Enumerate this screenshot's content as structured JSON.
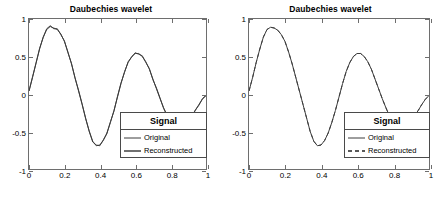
{
  "figure": {
    "background": "#ffffff",
    "axis_color": "#6e6e6e",
    "line_color": "#3c3c3c"
  },
  "panels": [
    {
      "id": "left",
      "title": "Daubechies wavelet",
      "legend": {
        "title": "Signal",
        "entries": [
          {
            "label": "Original",
            "style": "solid"
          },
          {
            "label": "Reconstructed",
            "style": "solid"
          }
        ]
      }
    },
    {
      "id": "right",
      "title": "Daubechies wavelet",
      "legend": {
        "title": "Signal",
        "entries": [
          {
            "label": "Original",
            "style": "solid"
          },
          {
            "label": "Reconstructed",
            "style": "dashed"
          }
        ]
      }
    }
  ],
  "axes": {
    "xticks": [
      "0",
      "0.2",
      "0.4",
      "0.6",
      "0.8",
      "1"
    ],
    "xtick_values": [
      0,
      0.2,
      0.4,
      0.6,
      0.8,
      1
    ],
    "yticks": [
      "1",
      "0.5",
      "0",
      "-0.5",
      "-1"
    ],
    "ytick_values": [
      1,
      0.5,
      0,
      -0.5,
      -1
    ],
    "xlim": [
      0,
      1
    ],
    "ylim": [
      -1,
      1
    ]
  },
  "chart_data": {
    "type": "line",
    "title": "Daubechies wavelet",
    "xlabel": "",
    "ylabel": "",
    "xlim": [
      0,
      1
    ],
    "ylim": [
      -1,
      1
    ],
    "grid": false,
    "legend_position": "lower right",
    "legend_title": "Signal",
    "charts": [
      {
        "panel": "left",
        "title": "Daubechies wavelet",
        "note": "Reconstructed signal overlays original; trace shows slight quantization ripple",
        "x": [
          0.0,
          0.02,
          0.04,
          0.06,
          0.08,
          0.1,
          0.12,
          0.14,
          0.16,
          0.18,
          0.2,
          0.22,
          0.24,
          0.26,
          0.28,
          0.3,
          0.32,
          0.34,
          0.36,
          0.38,
          0.4,
          0.42,
          0.44,
          0.46,
          0.48,
          0.5,
          0.52,
          0.54,
          0.56,
          0.58,
          0.6,
          0.62,
          0.64,
          0.66,
          0.68,
          0.7,
          0.72,
          0.74,
          0.76,
          0.78,
          0.8,
          0.82,
          0.84,
          0.86,
          0.88,
          0.9,
          0.92,
          0.94,
          0.96,
          0.98,
          1.0
        ],
        "series": [
          {
            "name": "Original",
            "style": "solid",
            "values": [
              0.04,
              0.22,
              0.42,
              0.6,
              0.76,
              0.86,
              0.9,
              0.88,
              0.86,
              0.8,
              0.7,
              0.56,
              0.4,
              0.22,
              0.04,
              -0.14,
              -0.32,
              -0.5,
              -0.63,
              -0.69,
              -0.68,
              -0.62,
              -0.52,
              -0.38,
              -0.22,
              -0.04,
              0.14,
              0.3,
              0.42,
              0.5,
              0.54,
              0.54,
              0.5,
              0.43,
              0.33,
              0.2,
              0.07,
              -0.06,
              -0.18,
              -0.29,
              -0.37,
              -0.41,
              -0.43,
              -0.43,
              -0.41,
              -0.36,
              -0.29,
              -0.22,
              -0.14,
              -0.07,
              -0.02
            ]
          },
          {
            "name": "Reconstructed",
            "style": "solid",
            "values": [
              0.04,
              0.23,
              0.41,
              0.61,
              0.75,
              0.87,
              0.91,
              0.87,
              0.87,
              0.79,
              0.71,
              0.55,
              0.41,
              0.21,
              0.05,
              -0.13,
              -0.33,
              -0.49,
              -0.64,
              -0.68,
              -0.69,
              -0.61,
              -0.53,
              -0.37,
              -0.23,
              -0.03,
              0.15,
              0.29,
              0.43,
              0.49,
              0.55,
              0.53,
              0.51,
              0.42,
              0.34,
              0.19,
              0.08,
              -0.05,
              -0.19,
              -0.28,
              -0.38,
              -0.4,
              -0.44,
              -0.42,
              -0.42,
              -0.35,
              -0.3,
              -0.21,
              -0.15,
              -0.06,
              -0.02
            ]
          }
        ]
      },
      {
        "panel": "right",
        "title": "Daubechies wavelet",
        "note": "Reconstructed drawn dashed; coincides with the original curve",
        "x": [
          0.0,
          0.02,
          0.04,
          0.06,
          0.08,
          0.1,
          0.12,
          0.14,
          0.16,
          0.18,
          0.2,
          0.22,
          0.24,
          0.26,
          0.28,
          0.3,
          0.32,
          0.34,
          0.36,
          0.38,
          0.4,
          0.42,
          0.44,
          0.46,
          0.48,
          0.5,
          0.52,
          0.54,
          0.56,
          0.58,
          0.6,
          0.62,
          0.64,
          0.66,
          0.68,
          0.7,
          0.72,
          0.74,
          0.76,
          0.78,
          0.8,
          0.82,
          0.84,
          0.86,
          0.88,
          0.9,
          0.92,
          0.94,
          0.96,
          0.98,
          1.0
        ],
        "series": [
          {
            "name": "Original",
            "style": "solid",
            "values": [
              0.04,
              0.22,
              0.42,
              0.6,
              0.76,
              0.86,
              0.89,
              0.88,
              0.85,
              0.79,
              0.7,
              0.56,
              0.4,
              0.22,
              0.04,
              -0.14,
              -0.32,
              -0.5,
              -0.63,
              -0.69,
              -0.68,
              -0.62,
              -0.52,
              -0.38,
              -0.22,
              -0.04,
              0.14,
              0.3,
              0.42,
              0.5,
              0.54,
              0.54,
              0.5,
              0.43,
              0.33,
              0.2,
              0.07,
              -0.06,
              -0.18,
              -0.29,
              -0.37,
              -0.41,
              -0.43,
              -0.43,
              -0.41,
              -0.36,
              -0.29,
              -0.22,
              -0.14,
              -0.07,
              -0.02
            ]
          },
          {
            "name": "Reconstructed",
            "style": "dashed",
            "values": [
              0.04,
              0.22,
              0.42,
              0.6,
              0.76,
              0.86,
              0.89,
              0.88,
              0.85,
              0.79,
              0.7,
              0.56,
              0.4,
              0.22,
              0.04,
              -0.14,
              -0.32,
              -0.5,
              -0.63,
              -0.69,
              -0.68,
              -0.62,
              -0.52,
              -0.38,
              -0.22,
              -0.04,
              0.14,
              0.3,
              0.42,
              0.5,
              0.54,
              0.54,
              0.5,
              0.43,
              0.33,
              0.2,
              0.07,
              -0.06,
              -0.18,
              -0.29,
              -0.37,
              -0.41,
              -0.43,
              -0.43,
              -0.41,
              -0.36,
              -0.29,
              -0.22,
              -0.14,
              -0.07,
              -0.02
            ]
          }
        ]
      }
    ]
  }
}
